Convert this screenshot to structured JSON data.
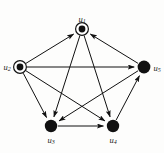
{
  "figure": {
    "kind": "directed-graph",
    "background_color": "#fdfdfc",
    "ink_color": "#111111",
    "width": 164,
    "height": 153
  },
  "graph": {
    "nodes": [
      {
        "id": "u1",
        "label": "u",
        "sub": "1",
        "x": 82,
        "y": 29,
        "style": "double-circle",
        "outer_r": 6.4,
        "inner_r": 3.4,
        "label_dx": 0,
        "label_dy": -9
      },
      {
        "id": "u2",
        "label": "u",
        "sub": "2",
        "x": 20,
        "y": 67,
        "style": "double-circle",
        "outer_r": 6.4,
        "inner_r": 3.4,
        "label_dx": -13,
        "label_dy": 1
      },
      {
        "id": "u3",
        "label": "u",
        "sub": "3",
        "x": 51,
        "y": 126,
        "style": "filled",
        "outer_r": 6.2,
        "inner_r": 6.2,
        "label_dx": 0,
        "label_dy": 15
      },
      {
        "id": "u4",
        "label": "u",
        "sub": "4",
        "x": 113,
        "y": 126,
        "style": "filled",
        "outer_r": 6.2,
        "inner_r": 6.2,
        "label_dx": 0,
        "label_dy": 15
      },
      {
        "id": "u5",
        "label": "u",
        "sub": "5",
        "x": 144,
        "y": 67,
        "style": "filled",
        "outer_r": 6.4,
        "inner_r": 6.4,
        "label_dx": 13,
        "label_dy": 2
      }
    ],
    "edges": [
      {
        "id": "e-u2-u1",
        "from": "u2",
        "to": "u1",
        "directed": true
      },
      {
        "id": "e-u5-u1",
        "from": "u5",
        "to": "u1",
        "directed": true
      },
      {
        "id": "e-u2-u5",
        "from": "u2",
        "to": "u5",
        "directed": true
      },
      {
        "id": "e-u2-u3",
        "from": "u2",
        "to": "u3",
        "directed": true
      },
      {
        "id": "e-u2-u4",
        "from": "u2",
        "to": "u4",
        "directed": true
      },
      {
        "id": "e-u1-u3",
        "from": "u1",
        "to": "u3",
        "directed": true
      },
      {
        "id": "e-u1-u4",
        "from": "u1",
        "to": "u4",
        "directed": true
      },
      {
        "id": "e-u5-u3",
        "from": "u5",
        "to": "u3",
        "directed": true
      },
      {
        "id": "e-u3-u4",
        "from": "u3",
        "to": "u4",
        "directed": true
      },
      {
        "id": "e-u4-u5",
        "from": "u4",
        "to": "u5",
        "directed": true
      }
    ]
  }
}
